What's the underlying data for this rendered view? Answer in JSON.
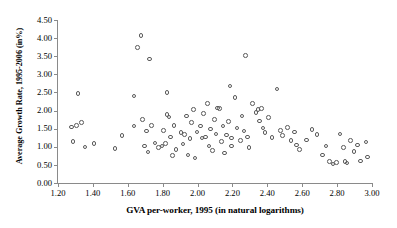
{
  "chart_data": {
    "type": "scatter",
    "title": "",
    "xlabel": "GVA per-worker, 1995 (in natural logarithms)",
    "ylabel": "Average Growth Rate, 1995-2006 (in%)",
    "xlim": [
      1.2,
      3.0
    ],
    "ylim": [
      0.0,
      4.5
    ],
    "xticks": [
      "1.20",
      "1.40",
      "1.60",
      "1.80",
      "2.00",
      "2.20",
      "2.40",
      "2.60",
      "2.80",
      "3.00"
    ],
    "yticks": [
      "0.00",
      "0.50",
      "1.00",
      "1.50",
      "2.00",
      "2.50",
      "3.00",
      "3.50",
      "4.00",
      "4.50"
    ],
    "grid": false,
    "legend": null,
    "marker": "open-circle",
    "marker_color": "#5a5a5a",
    "series": [
      {
        "name": "regions",
        "points": [
          [
            1.27,
            1.57
          ],
          [
            1.28,
            1.18
          ],
          [
            1.3,
            1.62
          ],
          [
            1.31,
            2.5
          ],
          [
            1.33,
            1.7
          ],
          [
            1.35,
            1.02
          ],
          [
            1.4,
            1.12
          ],
          [
            1.52,
            0.98
          ],
          [
            1.56,
            1.34
          ],
          [
            1.63,
            2.43
          ],
          [
            1.63,
            1.6
          ],
          [
            1.65,
            3.77
          ],
          [
            1.67,
            4.1
          ],
          [
            1.68,
            1.78
          ],
          [
            1.69,
            1.05
          ],
          [
            1.7,
            1.46
          ],
          [
            1.71,
            0.88
          ],
          [
            1.72,
            3.45
          ],
          [
            1.73,
            1.62
          ],
          [
            1.75,
            1.13
          ],
          [
            1.77,
            1.0
          ],
          [
            1.79,
            1.05
          ],
          [
            1.8,
            1.47
          ],
          [
            1.81,
            1.12
          ],
          [
            1.82,
            2.53
          ],
          [
            1.82,
            1.92
          ],
          [
            1.83,
            1.85
          ],
          [
            1.84,
            1.3
          ],
          [
            1.85,
            0.78
          ],
          [
            1.86,
            1.62
          ],
          [
            1.87,
            0.95
          ],
          [
            1.9,
            1.42
          ],
          [
            1.91,
            1.1
          ],
          [
            1.92,
            1.36
          ],
          [
            1.93,
            1.88
          ],
          [
            1.94,
            0.8
          ],
          [
            1.95,
            1.26
          ],
          [
            1.96,
            1.7
          ],
          [
            1.97,
            2.05
          ],
          [
            1.98,
            0.72
          ],
          [
            1.99,
            1.44
          ],
          [
            2.01,
            1.6
          ],
          [
            2.02,
            1.27
          ],
          [
            2.03,
            1.95
          ],
          [
            2.04,
            1.3
          ],
          [
            2.05,
            2.22
          ],
          [
            2.06,
            1.05
          ],
          [
            2.07,
            1.52
          ],
          [
            2.08,
            0.92
          ],
          [
            2.09,
            1.78
          ],
          [
            2.1,
            1.38
          ],
          [
            2.11,
            2.1
          ],
          [
            2.12,
            2.08
          ],
          [
            2.13,
            1.18
          ],
          [
            2.14,
            1.6
          ],
          [
            2.15,
            0.86
          ],
          [
            2.16,
            1.35
          ],
          [
            2.17,
            1.72
          ],
          [
            2.18,
            2.7
          ],
          [
            2.19,
            1.27
          ],
          [
            2.19,
            1.05
          ],
          [
            2.21,
            2.38
          ],
          [
            2.22,
            1.55
          ],
          [
            2.24,
            1.2
          ],
          [
            2.25,
            1.88
          ],
          [
            2.26,
            1.46
          ],
          [
            2.27,
            3.55
          ],
          [
            2.28,
            1.3
          ],
          [
            2.29,
            1.0
          ],
          [
            2.31,
            2.22
          ],
          [
            2.33,
            1.98
          ],
          [
            2.34,
            2.05
          ],
          [
            2.35,
            1.74
          ],
          [
            2.36,
            2.08
          ],
          [
            2.37,
            1.55
          ],
          [
            2.38,
            1.42
          ],
          [
            2.4,
            1.84
          ],
          [
            2.42,
            1.28
          ],
          [
            2.45,
            2.62
          ],
          [
            2.47,
            1.48
          ],
          [
            2.48,
            1.34
          ],
          [
            2.51,
            1.56
          ],
          [
            2.53,
            1.2
          ],
          [
            2.55,
            1.44
          ],
          [
            2.56,
            1.08
          ],
          [
            2.58,
            0.96
          ],
          [
            2.62,
            1.22
          ],
          [
            2.65,
            1.5
          ],
          [
            2.68,
            1.36
          ],
          [
            2.71,
            0.8
          ],
          [
            2.73,
            1.05
          ],
          [
            2.75,
            0.62
          ],
          [
            2.77,
            0.55
          ],
          [
            2.79,
            0.6
          ],
          [
            2.81,
            1.38
          ],
          [
            2.83,
            1.0
          ],
          [
            2.84,
            0.62
          ],
          [
            2.85,
            0.58
          ],
          [
            2.87,
            1.2
          ],
          [
            2.89,
            0.9
          ],
          [
            2.91,
            1.08
          ],
          [
            2.93,
            0.64
          ],
          [
            2.96,
            1.16
          ],
          [
            2.97,
            0.74
          ]
        ]
      }
    ]
  }
}
